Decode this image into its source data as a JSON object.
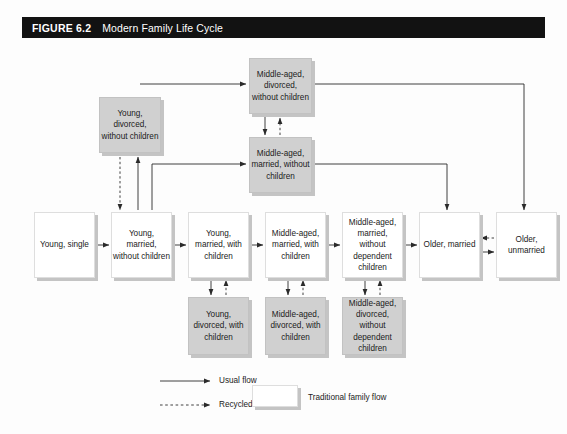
{
  "figure": {
    "label": "FIGURE 6.2",
    "title": "Modern Family Life Cycle"
  },
  "diagram": {
    "type": "flowchart",
    "nodes": [
      {
        "id": "middle_aged_divorced_without_children",
        "label": "Middle-aged, divorced, without children",
        "style": "shaded",
        "x": 249,
        "y": 58,
        "w": 63,
        "h": 56
      },
      {
        "id": "young_divorced_without_children",
        "label": "Young, divorced, without children",
        "style": "shaded",
        "x": 99,
        "y": 97,
        "w": 62,
        "h": 56
      },
      {
        "id": "middle_aged_married_without_children",
        "label": "Middle-aged, married, without children",
        "style": "shaded",
        "x": 249,
        "y": 137,
        "w": 63,
        "h": 56
      },
      {
        "id": "young_single",
        "label": "Young, single",
        "style": "traditional",
        "x": 34,
        "y": 212,
        "w": 61,
        "h": 66
      },
      {
        "id": "young_married_without_children",
        "label": "Young, married, without children",
        "style": "traditional",
        "x": 111,
        "y": 212,
        "w": 61,
        "h": 66
      },
      {
        "id": "young_married_with_children",
        "label": "Young, married, with children",
        "style": "traditional",
        "x": 188,
        "y": 212,
        "w": 61,
        "h": 66
      },
      {
        "id": "middle_aged_married_with_children",
        "label": "Middle-aged, married, with children",
        "style": "traditional",
        "x": 265,
        "y": 212,
        "w": 61,
        "h": 66
      },
      {
        "id": "middle_aged_married_without_dependent_children",
        "label": "Middle-aged, married, without dependent children",
        "style": "traditional",
        "x": 342,
        "y": 212,
        "w": 61,
        "h": 66
      },
      {
        "id": "older_married",
        "label": "Older, married",
        "style": "traditional",
        "x": 419,
        "y": 212,
        "w": 61,
        "h": 66
      },
      {
        "id": "older_unmarried",
        "label": "Older, unmarried",
        "style": "traditional",
        "x": 496,
        "y": 212,
        "w": 61,
        "h": 66
      },
      {
        "id": "young_divorced_with_children",
        "label": "Young, divorced, with children",
        "style": "shaded",
        "x": 188,
        "y": 297,
        "w": 61,
        "h": 58
      },
      {
        "id": "middle_aged_divorced_with_children",
        "label": "Middle-aged, divorced, with children",
        "style": "shaded",
        "x": 265,
        "y": 297,
        "w": 61,
        "h": 58
      },
      {
        "id": "middle_aged_divorced_without_dependent_children",
        "label": "Middle-aged, divorced, without dependent children",
        "style": "shaded",
        "x": 342,
        "y": 297,
        "w": 61,
        "h": 58
      }
    ],
    "edge_styles": {
      "usual": "solid",
      "recycled": "dashed"
    },
    "colors": {
      "shaded_fill": "#d0d0d0",
      "traditional_fill": "#ffffff",
      "shadow": "#c4c4c4",
      "line": "#2a2a2a",
      "title_bar": "#121212",
      "page": "#fdfdfd"
    }
  },
  "legend": {
    "usual_flow": "Usual flow",
    "recycled_flow": "Recycled flow",
    "traditional_family_flow": "Traditional family flow"
  }
}
